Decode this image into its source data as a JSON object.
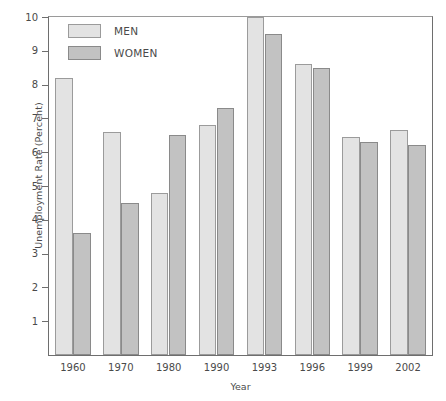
{
  "chart_data": {
    "type": "bar",
    "title": "",
    "xlabel": "Year",
    "ylabel": "Unemployment Rate (Percent)",
    "categories": [
      "1960",
      "1970",
      "1980",
      "1990",
      "1993",
      "1996",
      "1999",
      "2002"
    ],
    "series": [
      {
        "name": "MEN",
        "color": "#e3e3e3",
        "values": [
          8.2,
          6.6,
          4.8,
          6.8,
          10.0,
          8.6,
          6.45,
          6.65
        ]
      },
      {
        "name": "WOMEN",
        "color": "#c2c2c2",
        "values": [
          3.6,
          4.5,
          6.5,
          7.3,
          9.5,
          8.5,
          6.3,
          6.2
        ]
      }
    ],
    "ylim": [
      0,
      10
    ],
    "yticks": [
      "1",
      "2",
      "3",
      "4",
      "5",
      "6",
      "7",
      "8",
      "9",
      "10"
    ],
    "ytick_values": [
      1,
      2,
      3,
      4,
      5,
      6,
      7,
      8,
      9,
      10
    ],
    "grid": false,
    "legend_position": "top-left",
    "legend": [
      "MEN",
      "WOMEN"
    ]
  }
}
